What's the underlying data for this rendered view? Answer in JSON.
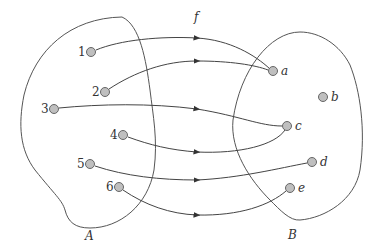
{
  "diagram": {
    "function_label": "f",
    "domain": {
      "label": "A",
      "elements": [
        {
          "id": "1",
          "label": "1",
          "x": 91,
          "y": 52
        },
        {
          "id": "2",
          "label": "2",
          "x": 105,
          "y": 92
        },
        {
          "id": "3",
          "label": "3",
          "x": 54,
          "y": 109
        },
        {
          "id": "4",
          "label": "4",
          "x": 123,
          "y": 135
        },
        {
          "id": "5",
          "label": "5",
          "x": 90,
          "y": 164
        },
        {
          "id": "6",
          "label": "6",
          "x": 119,
          "y": 187
        }
      ]
    },
    "codomain": {
      "label": "B",
      "elements": [
        {
          "id": "a",
          "label": "a",
          "x": 273,
          "y": 71
        },
        {
          "id": "b",
          "label": "b",
          "x": 323,
          "y": 97
        },
        {
          "id": "c",
          "label": "c",
          "x": 287,
          "y": 126
        },
        {
          "id": "d",
          "label": "d",
          "x": 312,
          "y": 162
        },
        {
          "id": "e",
          "label": "e",
          "x": 290,
          "y": 188
        }
      ]
    },
    "mappings": [
      {
        "from": "1",
        "to": "a"
      },
      {
        "from": "2",
        "to": "a"
      },
      {
        "from": "3",
        "to": "c"
      },
      {
        "from": "4",
        "to": "c"
      },
      {
        "from": "5",
        "to": "d"
      },
      {
        "from": "6",
        "to": "e"
      }
    ],
    "colors": {
      "stroke": "#444444",
      "node_fill": "#bfbfbf",
      "node_stroke": "#666666",
      "text": "#333333"
    }
  }
}
